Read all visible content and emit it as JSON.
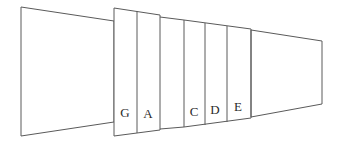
{
  "figure": {
    "background_color": "#ffffff",
    "line_color": "#5a5a5a",
    "label_color": "#2b2b2b",
    "width": 341,
    "height": 141
  },
  "sections": [
    {
      "id": "inlet",
      "label": "",
      "kind": "open-trapezoid",
      "points": "21,7 114,21 114,122 21,136"
    },
    {
      "id": "block-ga",
      "label": "",
      "kind": "panel-block",
      "points": "114,8 160,15 160,130 114,136"
    },
    {
      "id": "connector-1",
      "label": "",
      "kind": "connector",
      "top": "160,17 184,20",
      "bottom": "160,129 184,127"
    },
    {
      "id": "block-cde",
      "label": "",
      "kind": "panel-block",
      "points": "184,20 251,29 251,118 184,127"
    },
    {
      "id": "outlet",
      "label": "",
      "kind": "open-trapezoid",
      "points": "251,30 322,41 322,104 251,117"
    }
  ],
  "panels": [
    {
      "id": "panel-g",
      "label": "G",
      "label_x": 125,
      "label_y": 117
    },
    {
      "id": "panel-a",
      "label": "A",
      "label_x": 148,
      "label_y": 118
    },
    {
      "id": "panel-c",
      "label": "C",
      "label_x": 194,
      "label_y": 116
    },
    {
      "id": "panel-d",
      "label": "D",
      "label_x": 215,
      "label_y": 114
    },
    {
      "id": "panel-e",
      "label": "E",
      "label_x": 238,
      "label_y": 111
    }
  ],
  "dividers": [
    {
      "id": "divider-g-a",
      "path": "M137,11 L137,133"
    },
    {
      "id": "divider-c-d",
      "path": "M205,23 L205,125"
    },
    {
      "id": "divider-d-e",
      "path": "M227,26 L227,122"
    }
  ],
  "geometry": {
    "inlet_outline": "M21,7 L114,21 L114,122 L21,136 Z",
    "block_ga_outline": "M114,8 L160,15 L160,130 L114,136 Z",
    "connector_top": "M160,17 L184,20",
    "connector_bottom": "M160,129 L184,127",
    "block_cde_outline": "M184,20 L251,29 L251,118 L184,127 Z",
    "outlet_outline": "M251,30 L322,41 L322,104 L251,117 Z"
  }
}
